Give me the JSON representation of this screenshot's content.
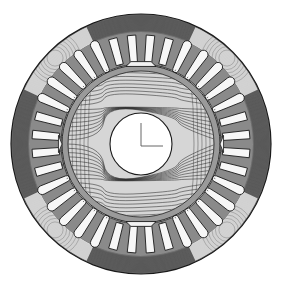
{
  "figure": {
    "description": "Finite-element magnetic flux line plot of a motor cross-section",
    "width": 281,
    "height": 285,
    "center": [
      141,
      144
    ],
    "colors": {
      "background": "#ffffff",
      "line": "#1a1a1a",
      "yoke_shade": "#6e6e6e",
      "tooth_shade": "#8a8a8a",
      "slot_fill": "#f7f7f7",
      "flux_line": "#2a2a2a"
    },
    "stator": {
      "outer_radius": 130,
      "slot_count": 36,
      "slot_outer_radius": 109,
      "slot_inner_radius": 82,
      "slot_width_outer": 9,
      "slot_width_inner": 6,
      "flux_lines_yoke": 18
    },
    "airgap": {
      "stator_bore_radius": 80
    },
    "rotor": {
      "outer_radius": 79,
      "ring_inner_radius": 73,
      "flux_lines": 34,
      "pole_pieces": [
        {
          "angle": -90,
          "label": "top-pole"
        },
        {
          "angle": 90,
          "label": "bottom-pole"
        },
        {
          "angle": 180,
          "label": "left-pole"
        },
        {
          "angle": 0,
          "label": "right-pole"
        }
      ]
    },
    "shaft": {
      "radius": 31,
      "axis_marker": {
        "vertical": [
          [
            141,
            123
          ],
          [
            141,
            146
          ]
        ],
        "horizontal": [
          [
            141,
            146
          ],
          [
            163,
            146
          ]
        ]
      }
    }
  }
}
